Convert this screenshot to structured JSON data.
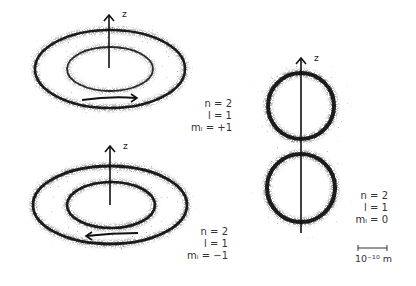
{
  "figure": {
    "panels": [
      {
        "id": "ml-plus-1",
        "axis_label": "z",
        "rotation": "counterclockwise-right-arrow",
        "quantum_numbers": {
          "n": "n = 2",
          "l": "l = 1",
          "ml": "mₗ = +1"
        }
      },
      {
        "id": "ml-minus-1",
        "axis_label": "z",
        "rotation": "left-arrow",
        "quantum_numbers": {
          "n": "n = 2",
          "l": "l = 1",
          "ml": "mₗ = −1"
        }
      },
      {
        "id": "ml-zero",
        "axis_label": "z",
        "quantum_numbers": {
          "n": "n = 2",
          "l": "l = 1",
          "ml": "mₗ = 0"
        }
      }
    ],
    "scale_bar": {
      "label": "10⁻¹⁰ m"
    },
    "colors": {
      "ink": "#111111",
      "text": "#333333",
      "background": "#ffffff"
    }
  }
}
